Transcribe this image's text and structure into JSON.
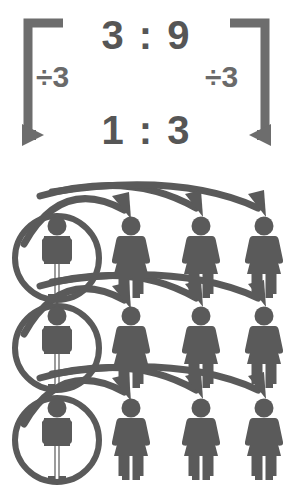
{
  "background_color": "#ffffff",
  "ink_color": "#5a5a5a",
  "ratio_panel": {
    "top_ratio": "3 : 9",
    "bottom_ratio": "1 : 3",
    "left_operation": "÷3",
    "right_operation": "÷3",
    "left_bracket_name": "left-bracket-arrow",
    "right_bracket_name": "right-bracket-arrow",
    "arrow_direction_left": "down-right",
    "arrow_direction_right": "down-left"
  },
  "figures_panel": {
    "rows": 3,
    "columns": 4,
    "male_per_row": 1,
    "female_per_row": 3,
    "circled_column": 1,
    "arrows_per_row": 3,
    "row_labels": [
      "row-1",
      "row-2",
      "row-3"
    ],
    "column_centers": [
      57,
      131,
      201,
      264
    ],
    "row_centers": [
      90,
      180,
      272
    ],
    "figures": [
      {
        "row": 1,
        "items": [
          "male-circled",
          "female",
          "female",
          "female"
        ]
      },
      {
        "row": 2,
        "items": [
          "male-circled",
          "female",
          "female",
          "female"
        ]
      },
      {
        "row": 3,
        "items": [
          "male-circled",
          "female",
          "female",
          "female"
        ]
      }
    ]
  },
  "meaning": {
    "ratio_simplified_from": "3 : 9",
    "ratio_simplified_to": "1 : 3",
    "divide_by": 3
  }
}
